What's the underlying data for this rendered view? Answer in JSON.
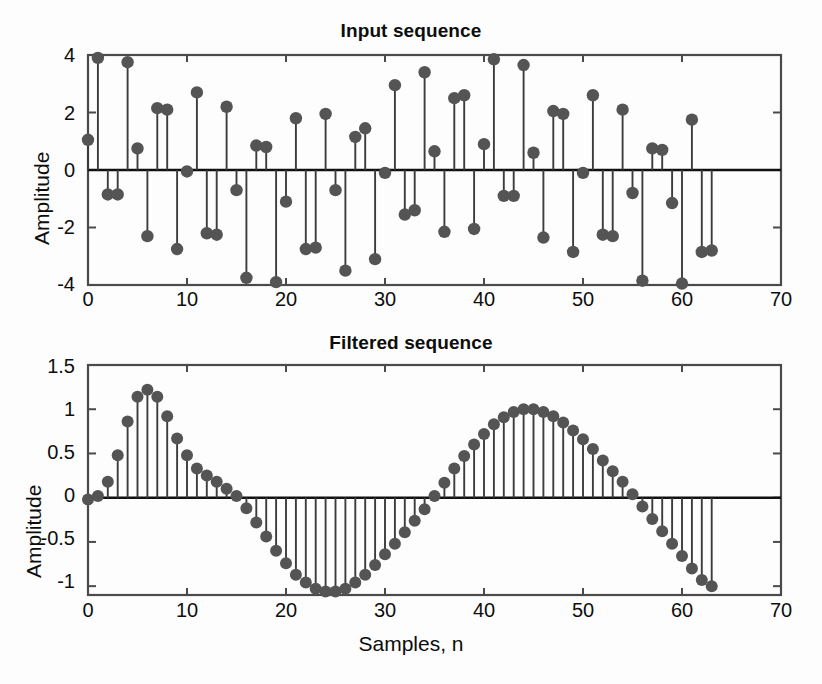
{
  "figure": {
    "background_color": "#fdfdfd",
    "marker_color": "#545454",
    "stem_color": "#3c3c3c",
    "axis_color": "#4a4a4a"
  },
  "top_plot": {
    "title": "Input sequence",
    "ylabel": "Amplitude",
    "xticklabels": [
      "0",
      "10",
      "20",
      "30",
      "40",
      "50",
      "60",
      "70"
    ],
    "yticklabels": [
      "4",
      "2",
      "0",
      "-2",
      "-4"
    ]
  },
  "bottom_plot": {
    "title": "Filtered sequence",
    "ylabel": "Amplitude",
    "xlabel": "Samples, n",
    "xticklabels": [
      "0",
      "10",
      "20",
      "30",
      "40",
      "50",
      "60",
      "70"
    ],
    "yticklabels": [
      "1.5",
      "1",
      "0.5",
      "0",
      "-0.5",
      "-1"
    ]
  },
  "chart_data": [
    {
      "type": "line",
      "plot_style": "stem",
      "title": "Input sequence",
      "xlabel": "",
      "ylabel": "Amplitude",
      "xlim": [
        0,
        70
      ],
      "ylim": [
        -4,
        4
      ],
      "xticks": [
        0,
        10,
        20,
        30,
        40,
        50,
        60,
        70
      ],
      "yticks": [
        -4,
        -2,
        0,
        2,
        4
      ],
      "grid": false,
      "legend": null,
      "x": [
        0,
        1,
        2,
        3,
        4,
        5,
        6,
        7,
        8,
        9,
        10,
        11,
        12,
        13,
        14,
        15,
        16,
        17,
        18,
        19,
        20,
        21,
        22,
        23,
        24,
        25,
        26,
        27,
        28,
        29,
        30,
        31,
        32,
        33,
        34,
        35,
        36,
        37,
        38,
        39,
        40,
        41,
        42,
        43,
        44,
        45,
        46,
        47,
        48,
        49,
        50,
        51,
        52,
        53,
        54,
        55,
        56,
        57,
        58,
        59,
        60,
        61,
        62,
        63
      ],
      "y": [
        1.05,
        3.9,
        -0.85,
        -0.85,
        3.75,
        0.75,
        -2.3,
        2.15,
        2.1,
        -2.75,
        -0.05,
        2.7,
        -2.2,
        -2.25,
        2.2,
        -0.7,
        -3.75,
        0.85,
        0.8,
        -3.9,
        -1.1,
        1.8,
        -2.75,
        -2.7,
        1.95,
        -0.7,
        -3.5,
        1.15,
        1.45,
        -3.1,
        -0.1,
        2.95,
        -1.55,
        -1.4,
        3.4,
        0.65,
        -2.15,
        2.5,
        2.6,
        -2.05,
        0.9,
        3.85,
        -0.9,
        -0.9,
        3.65,
        0.6,
        -2.35,
        2.05,
        1.95,
        -2.85,
        -0.1,
        2.6,
        -2.25,
        -2.3,
        2.1,
        -0.8,
        -3.85,
        0.75,
        0.7,
        -1.15,
        -3.95,
        1.75,
        -2.85,
        -2.8
      ]
    },
    {
      "type": "line",
      "plot_style": "stem",
      "title": "Filtered sequence",
      "xlabel": "Samples, n",
      "ylabel": "Amplitude",
      "xlim": [
        0,
        70
      ],
      "ylim": [
        -1.1,
        1.5
      ],
      "xticks": [
        0,
        10,
        20,
        30,
        40,
        50,
        60,
        70
      ],
      "yticks": [
        -1,
        -0.5,
        0,
        0.5,
        1,
        1.5
      ],
      "grid": false,
      "legend": null,
      "x": [
        0,
        1,
        2,
        3,
        4,
        5,
        6,
        7,
        8,
        9,
        10,
        11,
        12,
        13,
        14,
        15,
        16,
        17,
        18,
        19,
        20,
        21,
        22,
        23,
        24,
        25,
        26,
        27,
        28,
        29,
        30,
        31,
        32,
        33,
        34,
        35,
        36,
        37,
        38,
        39,
        40,
        41,
        42,
        43,
        44,
        45,
        46,
        47,
        48,
        49,
        50,
        51,
        52,
        53,
        54,
        55,
        56,
        57,
        58,
        59,
        60,
        61,
        62,
        63
      ],
      "y": [
        -0.02,
        0.02,
        0.18,
        0.48,
        0.86,
        1.14,
        1.22,
        1.14,
        0.92,
        0.67,
        0.48,
        0.33,
        0.25,
        0.18,
        0.1,
        0.02,
        -0.12,
        -0.28,
        -0.44,
        -0.6,
        -0.74,
        -0.87,
        -0.96,
        -1.03,
        -1.06,
        -1.06,
        -1.03,
        -0.96,
        -0.87,
        -0.76,
        -0.64,
        -0.52,
        -0.39,
        -0.26,
        -0.13,
        0.02,
        0.17,
        0.33,
        0.47,
        0.6,
        0.72,
        0.83,
        0.91,
        0.97,
        1.0,
        1.0,
        0.97,
        0.92,
        0.85,
        0.76,
        0.66,
        0.55,
        0.42,
        0.3,
        0.18,
        0.04,
        -0.1,
        -0.24,
        -0.38,
        -0.52,
        -0.66,
        -0.8,
        -0.93,
        -1.0
      ]
    }
  ]
}
